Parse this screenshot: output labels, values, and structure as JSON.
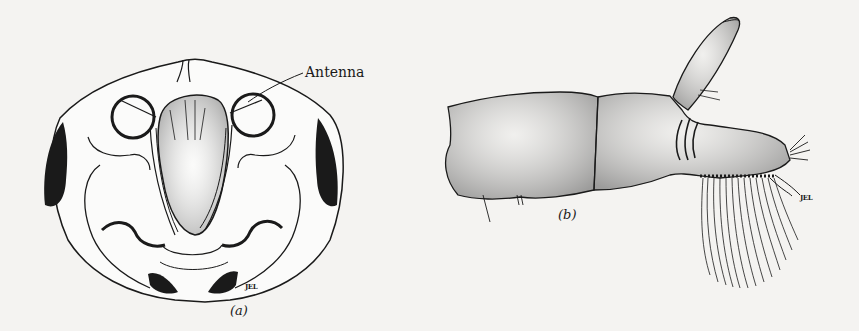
{
  "figure": {
    "panels": [
      {
        "id": "a",
        "label": "(a)",
        "subject": "Head, frontal view",
        "callouts": [
          {
            "text": "Antenna"
          }
        ],
        "signature": "JEL"
      },
      {
        "id": "b",
        "label": "(b)",
        "subject": "Appendage, lateral view",
        "signature": "JEL"
      }
    ],
    "colors": {
      "ink": "#1a1a1a",
      "paper": "#f4f3f1"
    }
  }
}
